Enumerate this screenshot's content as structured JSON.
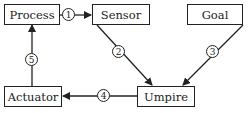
{
  "nodes": {
    "process": "Process",
    "sensor": "Sensor",
    "goal": "Goal",
    "umpire": "Umpire",
    "actuator": "Actuator"
  },
  "edges": [
    {
      "label": "1",
      "from": "Process",
      "to": "Sensor"
    },
    {
      "label": "2",
      "from": "Sensor",
      "to": "Umpire"
    },
    {
      "label": "3",
      "from": "Goal",
      "to": "Umpire"
    },
    {
      "label": "4",
      "from": "Umpire",
      "to": "Actuator"
    },
    {
      "label": "5",
      "from": "Actuator",
      "to": "Process"
    }
  ]
}
